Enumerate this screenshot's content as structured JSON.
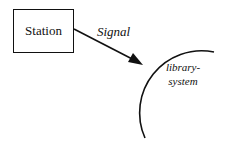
{
  "nodes": {
    "station": {
      "label": "Station"
    },
    "system": {
      "line1": "library-",
      "line2": "system"
    }
  },
  "edge": {
    "label": "Signal"
  }
}
